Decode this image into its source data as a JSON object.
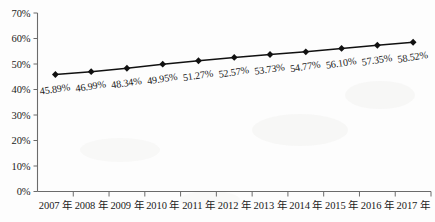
{
  "chart_data": {
    "type": "line",
    "title": "",
    "xlabel": "",
    "ylabel": "",
    "categories": [
      "2007 年",
      "2008 年",
      "2009 年",
      "2010 年",
      "2011 年",
      "2012 年",
      "2013 年",
      "2014 年",
      "2015 年",
      "2016 年",
      "2017 年"
    ],
    "values": [
      45.89,
      46.99,
      48.34,
      49.95,
      51.27,
      52.57,
      53.73,
      54.77,
      56.1,
      57.35,
      58.52
    ],
    "point_labels": [
      "45.89%",
      "46.99%",
      "48.34%",
      "49.95%",
      "51.27%",
      "52.57%",
      "53.73%",
      "54.77%",
      "56.10%",
      "57.35%",
      "58.52%"
    ],
    "ylim": [
      0,
      70
    ],
    "yticks": [
      0,
      10,
      20,
      30,
      40,
      50,
      60,
      70
    ],
    "ytick_labels": [
      "0%",
      "10%",
      "20%",
      "30%",
      "40%",
      "50%",
      "60%",
      "70%"
    ],
    "grid": false,
    "legend": "none",
    "series_color": "#111111",
    "marker": "diamond",
    "axis_color": "#6b6b6b"
  }
}
